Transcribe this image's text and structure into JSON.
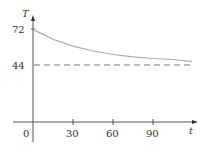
{
  "chart_data": {
    "type": "line",
    "title": "",
    "xlabel": "t",
    "ylabel": "T",
    "xticks": [
      "0",
      "30",
      "60",
      "90"
    ],
    "yticks": [
      "44",
      "72"
    ],
    "xlim": [
      0,
      120
    ],
    "ylim": [
      0,
      80
    ],
    "grid": false,
    "series": [
      {
        "name": "T(t)",
        "style": "solid",
        "color": "#999999",
        "x": [
          0,
          15,
          30,
          45,
          60,
          75,
          90,
          105,
          119
        ],
        "y": [
          72,
          64.4,
          59.0,
          55.2,
          52.5,
          50.6,
          49.4,
          48.6,
          47.0
        ]
      },
      {
        "name": "T = 44 asymptote",
        "style": "dashed",
        "color": "#666666",
        "x": [
          0,
          119
        ],
        "y": [
          44,
          44
        ]
      }
    ]
  },
  "labels": {
    "y_axis": "T",
    "x_axis": "t",
    "origin": "0",
    "y72": "72",
    "y44": "44",
    "x30": "30",
    "x60": "60",
    "x90": "90"
  }
}
